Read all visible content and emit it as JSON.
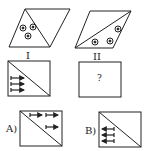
{
  "puzzle": {
    "figure_1": {
      "label": "I",
      "shape": "parallelogram",
      "symbols": 3,
      "symbol_icon": "circled-dot"
    },
    "figure_2": {
      "label": "II",
      "shape": "parallelogram",
      "symbols": 3,
      "symbol_icon": "circled-dot"
    },
    "figure_3": {
      "shape": "rectangle",
      "arrows": 3,
      "arrow_direction": "right"
    },
    "figure_4": {
      "shape": "rectangle",
      "question_mark": "?"
    },
    "options": [
      {
        "label": "A)",
        "arrows": 3,
        "arrow_direction": "right"
      },
      {
        "label": "B)",
        "arrows": 3,
        "arrow_direction": "left"
      }
    ]
  },
  "colors": {
    "stroke": "#222222",
    "background": "#ffffff"
  }
}
